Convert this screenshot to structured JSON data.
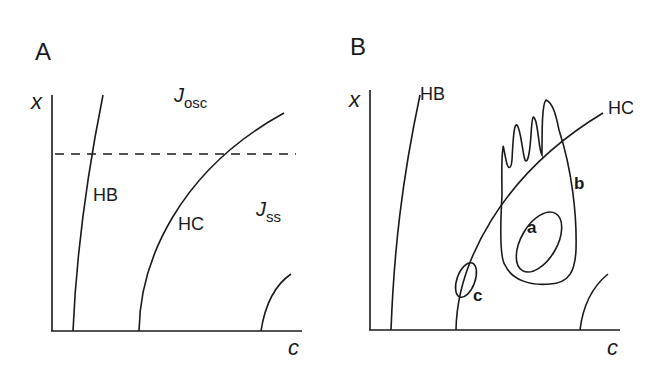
{
  "figure": {
    "panels": [
      {
        "id": "A",
        "label": "A",
        "y_axis_label": "x",
        "x_axis_label": "c",
        "curves": [
          {
            "name": "HB",
            "label": "HB"
          },
          {
            "name": "HC",
            "label": "HC"
          }
        ],
        "regions": [
          {
            "name": "J_osc",
            "main": "J",
            "sub": "osc"
          },
          {
            "name": "J_ss",
            "main": "J",
            "sub": "ss"
          }
        ],
        "dashed_line": "horizontal reference line"
      },
      {
        "id": "B",
        "label": "B",
        "y_axis_label": "x",
        "x_axis_label": "c",
        "curves": [
          {
            "name": "HB",
            "label": "HB"
          },
          {
            "name": "HC",
            "label": "HC"
          }
        ],
        "trajectories": [
          {
            "name": "a",
            "label": "a"
          },
          {
            "name": "b",
            "label": "b"
          },
          {
            "name": "c",
            "label": "c"
          }
        ]
      }
    ],
    "colors": {
      "ink": "#1a1a1a",
      "background": "#ffffff"
    }
  }
}
